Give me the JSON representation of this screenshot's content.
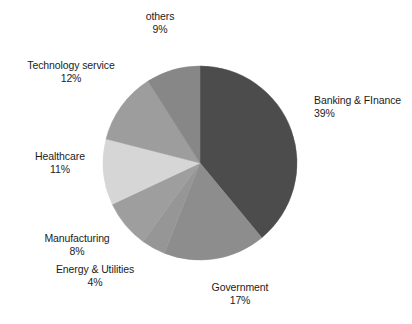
{
  "chart_data": {
    "type": "pie",
    "title": "",
    "subtitle": "",
    "xlabel": "",
    "ylabel": "",
    "legend_position": "none",
    "grid": false,
    "start_angle_deg": 0,
    "direction": "clockwise",
    "units": "percent",
    "total": 100,
    "categories": [
      "Banking & FInance",
      "Government",
      "Energy & Utilities",
      "Manufacturing",
      "Healthcare",
      "Technology service",
      "others"
    ],
    "values": [
      39,
      17,
      4,
      8,
      11,
      12,
      9
    ],
    "colors": [
      "#4c4c4c",
      "#8d8d8d",
      "#969696",
      "#9e9e9e",
      "#d6d6d6",
      "#9d9d9d",
      "#878787"
    ],
    "slices": [
      {
        "label": "Banking & FInance",
        "value": 39,
        "percent_text": "39%",
        "color": "#4c4c4c",
        "label_id": "label-banking"
      },
      {
        "label": "Government",
        "value": 17,
        "percent_text": "17%",
        "color": "#8d8d8d",
        "label_id": "label-government"
      },
      {
        "label": "Energy & Utilities",
        "value": 4,
        "percent_text": "4%",
        "color": "#969696",
        "label_id": "label-energy"
      },
      {
        "label": "Manufacturing",
        "value": 8,
        "percent_text": "8%",
        "color": "#9e9e9e",
        "label_id": "label-manufacturing"
      },
      {
        "label": "Healthcare",
        "value": 11,
        "percent_text": "11%",
        "color": "#d6d6d6",
        "label_id": "label-healthcare"
      },
      {
        "label": "Technology service",
        "value": 12,
        "percent_text": "12%",
        "color": "#9d9d9d",
        "label_id": "label-technology"
      },
      {
        "label": "others",
        "value": 9,
        "percent_text": "9%",
        "color": "#878787",
        "label_id": "label-others"
      }
    ],
    "geometry": {
      "center_x": 200,
      "center_y": 163,
      "radius": 97
    }
  },
  "labels": {
    "banking": {
      "name": "Banking & FInance",
      "pct": "39%"
    },
    "government": {
      "name": "Government",
      "pct": "17%"
    },
    "energy": {
      "name": "Energy & Utilities",
      "pct": "4%"
    },
    "manufacturing": {
      "name": "Manufacturing",
      "pct": "8%"
    },
    "healthcare": {
      "name": "Healthcare",
      "pct": "11%"
    },
    "technology": {
      "name": "Technology service",
      "pct": "12%"
    },
    "others": {
      "name": "others",
      "pct": "9%"
    }
  }
}
